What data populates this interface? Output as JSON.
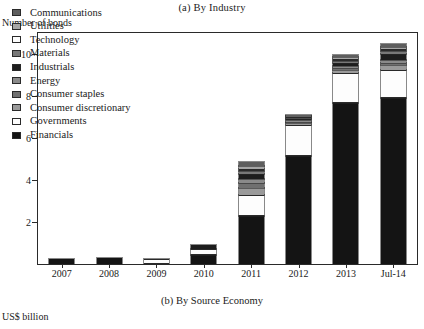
{
  "panel": {
    "top_title": "(a) By Industry",
    "y_axis_label": "Number of bonds",
    "bottom_title": "(b) By Source Economy",
    "bottom_unit": "US$ billion"
  },
  "chart_data": {
    "type": "bar",
    "stacked": true,
    "title": "(a) By Industry",
    "xlabel": "",
    "ylabel": "Number of bonds",
    "ylim": [
      0,
      11
    ],
    "yticks": [
      2,
      4,
      6,
      8,
      10
    ],
    "grid": false,
    "legend_position": "top-left",
    "categories": [
      "2007",
      "2008",
      "2009",
      "2010",
      "2011",
      "2012",
      "2013",
      "Jul-14"
    ],
    "series": [
      {
        "name": "Financials",
        "key": "fin",
        "swatch": "#141414",
        "values": [
          0.22,
          0.3,
          0.0,
          0.42,
          2.3,
          5.15,
          7.65,
          7.9
        ]
      },
      {
        "name": "Governments",
        "key": "gov",
        "swatch": "#ffffff",
        "values": [
          0.0,
          0.0,
          0.26,
          0.3,
          1.0,
          1.45,
          1.45,
          1.35
        ]
      },
      {
        "name": "Consumer discretionary",
        "key": "cdis",
        "swatch": "#9a9a9a",
        "values": [
          0.0,
          0.0,
          0.0,
          0.0,
          0.33,
          0.1,
          0.15,
          0.22
        ]
      },
      {
        "name": "Consumer staples",
        "key": "cstap",
        "swatch": "#707070",
        "values": [
          0.0,
          0.0,
          0.0,
          0.0,
          0.22,
          0.08,
          0.1,
          0.12
        ]
      },
      {
        "name": "Energy",
        "key": "ener",
        "swatch": "#8a8a8a",
        "values": [
          0.0,
          0.0,
          0.0,
          0.0,
          0.2,
          0.06,
          0.1,
          0.12
        ]
      },
      {
        "name": "Industrials",
        "key": "ind",
        "swatch": "#1d1d1d",
        "values": [
          0.0,
          0.0,
          0.0,
          0.2,
          0.22,
          0.08,
          0.12,
          0.3
        ]
      },
      {
        "name": "Materials",
        "key": "mat",
        "swatch": "#787878",
        "values": [
          0.0,
          0.0,
          0.0,
          0.0,
          0.15,
          0.05,
          0.1,
          0.12
        ]
      },
      {
        "name": "Technology",
        "key": "tech",
        "swatch": "#ffffff",
        "values": [
          0.0,
          0.0,
          0.0,
          0.0,
          0.12,
          0.04,
          0.08,
          0.1
        ]
      },
      {
        "name": "Utilities",
        "key": "util",
        "swatch": "#a6a6a6",
        "values": [
          0.0,
          0.0,
          0.0,
          0.0,
          0.15,
          0.05,
          0.1,
          0.12
        ]
      },
      {
        "name": "Communications",
        "key": "comm",
        "swatch": "#5e5e5e",
        "values": [
          0.0,
          0.0,
          0.0,
          0.0,
          0.16,
          0.04,
          0.08,
          0.12
        ]
      }
    ],
    "totals": [
      0.22,
      0.3,
      0.26,
      0.92,
      4.85,
      7.1,
      9.83,
      10.47
    ]
  },
  "legend": {
    "items": [
      {
        "label": "Communications",
        "key": "comm"
      },
      {
        "label": "Utilities",
        "key": "util"
      },
      {
        "label": "Technology",
        "key": "tech"
      },
      {
        "label": "Materials",
        "key": "mat"
      },
      {
        "label": "Industrials",
        "key": "ind"
      },
      {
        "label": "Energy",
        "key": "ener"
      },
      {
        "label": "Consumer staples",
        "key": "cstap"
      },
      {
        "label": "Consumer discretionary",
        "key": "cdis"
      },
      {
        "label": "Governments",
        "key": "gov"
      },
      {
        "label": "Financials",
        "key": "fin"
      }
    ]
  }
}
